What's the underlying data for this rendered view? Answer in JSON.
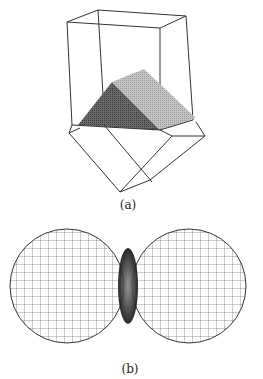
{
  "figure": {
    "panels": [
      {
        "label": "(a)",
        "description": "Wireframe box intersecting a rotated wireframe box; intersection volume shown as shaded wedge"
      },
      {
        "label": "(b)",
        "description": "Two intersecting wireframe spheres with shaded lens-shaped intersection region"
      }
    ]
  }
}
